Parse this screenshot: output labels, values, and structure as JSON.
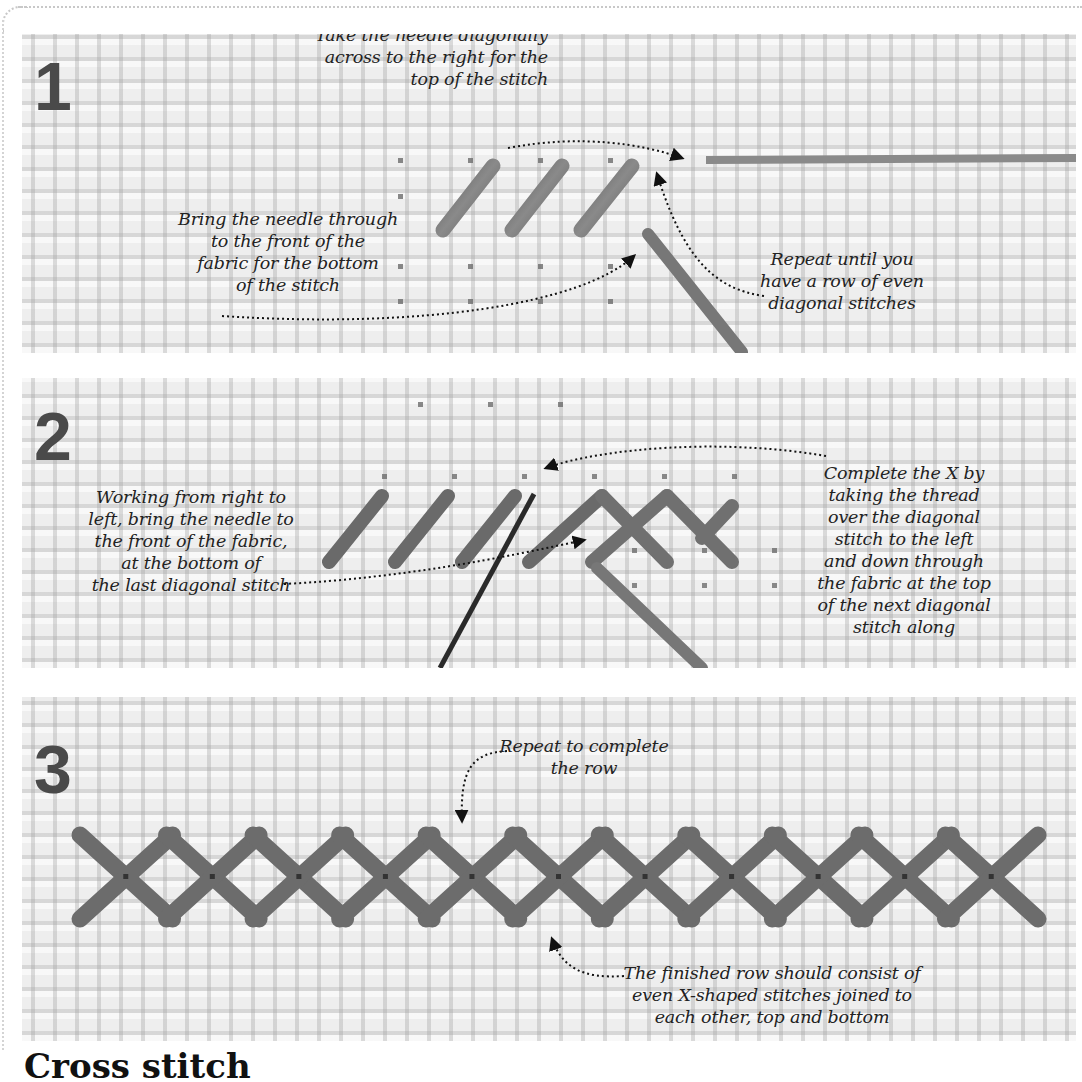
{
  "page": {
    "title": "Cross stitch",
    "background": "#ffffff",
    "fabric_color": "#e6e6e6",
    "thread_color": "#6b6b6b",
    "needle_color": "#3a3a3a",
    "text_color": "#222222",
    "number_color": "#4a4a4a"
  },
  "steps": [
    {
      "number": "1",
      "annotations": [
        {
          "id": "needle-diagonal",
          "text": "Take the needle diagonally\nacross to the right for the\ntop of the stitch"
        },
        {
          "id": "bring-through",
          "text": "Bring the needle through\nto the front of the\nfabric for the bottom\nof the stitch"
        },
        {
          "id": "repeat-row",
          "text": "Repeat until you\nhave a row of even\ndiagonal stitches"
        }
      ],
      "diagonal_stitch_count": 3
    },
    {
      "number": "2",
      "annotations": [
        {
          "id": "right-to-left",
          "text": "Working from right to\nleft, bring the needle to\nthe front of the fabric,\nat the bottom of\nthe last diagonal stitch"
        },
        {
          "id": "complete-x",
          "text": "Complete the X by\ntaking the thread\nover the diagonal\nstitch to the left\nand down through\nthe fabric at the top\nof the next diagonal\nstitch along"
        }
      ],
      "diagonal_stitch_count": 3,
      "completed_x_count": 2
    },
    {
      "number": "3",
      "annotations": [
        {
          "id": "repeat-complete",
          "text": "Repeat to complete\nthe row"
        },
        {
          "id": "finished-row",
          "text": "The finished row should consist of\neven X-shaped stitches joined to\neach other, top and bottom"
        }
      ],
      "x_stitch_count": 11
    }
  ]
}
